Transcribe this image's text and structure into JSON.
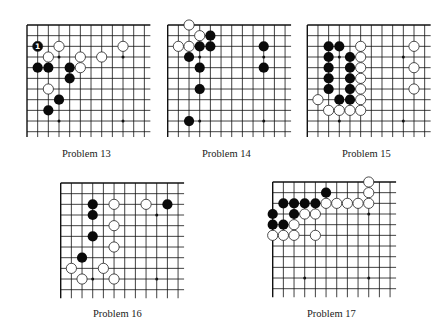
{
  "page": {
    "colors": {
      "line": "#111111",
      "black_stone": "#0a0a0a",
      "white_stone": "#ffffff",
      "background": "#ffffff"
    }
  },
  "problems": [
    {
      "id": "p13",
      "label": "Problem 13",
      "origin": [
        27,
        25
      ],
      "spacing": 10.67,
      "cols": 12,
      "rows": 11,
      "extend": [
        1.0,
        10.5
      ],
      "edges": {
        "top": true,
        "left": true
      },
      "star_points": [
        [
          3,
          3
        ],
        [
          9,
          3
        ],
        [
          3,
          9
        ],
        [
          9,
          9
        ]
      ],
      "black": [
        [
          1,
          4
        ],
        [
          2,
          4
        ],
        [
          4,
          4
        ],
        [
          4,
          5
        ],
        [
          3,
          7
        ],
        [
          2,
          8
        ]
      ],
      "white": [
        [
          3,
          2
        ],
        [
          2,
          3
        ],
        [
          5,
          3
        ],
        [
          5,
          4
        ],
        [
          7,
          3
        ],
        [
          9,
          2
        ],
        [
          2,
          6
        ]
      ],
      "numbered": [
        {
          "pos": [
            1,
            2
          ],
          "color": "black",
          "text": "1"
        }
      ],
      "label_pos": [
        62,
        150
      ]
    },
    {
      "id": "p14",
      "label": "Problem 14",
      "origin": [
        167.7,
        25
      ],
      "spacing": 10.67,
      "cols": 12,
      "rows": 11,
      "extend": [
        1.0,
        10.5
      ],
      "edges": {
        "top": true,
        "left": true
      },
      "star_points": [
        [
          3,
          3
        ],
        [
          9,
          3
        ],
        [
          3,
          9
        ],
        [
          9,
          9
        ]
      ],
      "black": [
        [
          4,
          1
        ],
        [
          3,
          2
        ],
        [
          4,
          2
        ],
        [
          2,
          3
        ],
        [
          3,
          4
        ],
        [
          3,
          6
        ],
        [
          2,
          9
        ],
        [
          9,
          2
        ],
        [
          9,
          4
        ]
      ],
      "white": [
        [
          2,
          0
        ],
        [
          3,
          1
        ],
        [
          1,
          2
        ],
        [
          2,
          2
        ]
      ],
      "numbered": [],
      "label_pos": [
        202,
        150
      ]
    },
    {
      "id": "p15",
      "label": "Problem 15",
      "origin": [
        307.3,
        25
      ],
      "spacing": 10.67,
      "cols": 12,
      "rows": 11,
      "extend": [
        1.0,
        10.5
      ],
      "edges": {
        "top": true,
        "left": true
      },
      "star_points": [
        [
          3,
          3
        ],
        [
          9,
          3
        ],
        [
          3,
          9
        ],
        [
          9,
          9
        ]
      ],
      "black": [
        [
          2,
          2
        ],
        [
          3,
          2
        ],
        [
          2,
          3
        ],
        [
          4,
          3
        ],
        [
          2,
          4
        ],
        [
          4,
          4
        ],
        [
          2,
          5
        ],
        [
          4,
          5
        ],
        [
          2,
          6
        ],
        [
          4,
          6
        ],
        [
          3,
          7
        ],
        [
          4,
          7
        ]
      ],
      "white": [
        [
          5,
          2
        ],
        [
          5,
          3
        ],
        [
          5,
          4
        ],
        [
          5,
          5
        ],
        [
          5,
          6
        ],
        [
          1,
          7
        ],
        [
          5,
          7
        ],
        [
          2,
          8
        ],
        [
          3,
          8
        ],
        [
          4,
          8
        ],
        [
          5,
          8
        ],
        [
          10,
          2
        ],
        [
          10,
          4
        ],
        [
          10,
          6
        ]
      ],
      "numbered": [],
      "label_pos": [
        342,
        150
      ]
    },
    {
      "id": "p16",
      "label": "Problem 16",
      "origin": [
        60.7,
        183
      ],
      "spacing": 10.67,
      "cols": 12,
      "rows": 11,
      "extend": [
        1.0,
        10.8
      ],
      "edges": {
        "top": true,
        "left": true
      },
      "star_points": [
        [
          3,
          3
        ],
        [
          9,
          3
        ],
        [
          3,
          9
        ],
        [
          9,
          9
        ]
      ],
      "black": [
        [
          3,
          2
        ],
        [
          3,
          3
        ],
        [
          3,
          5
        ],
        [
          2,
          7
        ],
        [
          10,
          2
        ]
      ],
      "white": [
        [
          5,
          2
        ],
        [
          8,
          2
        ],
        [
          5,
          4
        ],
        [
          5,
          6
        ],
        [
          1,
          8
        ],
        [
          4,
          8
        ],
        [
          2,
          9
        ],
        [
          5,
          9
        ]
      ],
      "numbered": [],
      "label_pos": [
        93,
        310
      ]
    },
    {
      "id": "p17",
      "label": "Problem 17",
      "origin": [
        272.7,
        182
      ],
      "spacing": 10.67,
      "cols": 12,
      "rows": 11,
      "extend": [
        1.0,
        10.8
      ],
      "edges": {
        "top": true,
        "left": true
      },
      "star_points": [
        [
          3,
          3
        ],
        [
          9,
          3
        ],
        [
          3,
          9
        ],
        [
          9,
          9
        ]
      ],
      "black": [
        [
          5,
          1
        ],
        [
          1,
          2
        ],
        [
          2,
          2
        ],
        [
          3,
          2
        ],
        [
          4,
          2
        ],
        [
          0,
          3
        ],
        [
          2,
          3
        ],
        [
          0,
          4
        ],
        [
          1,
          4
        ]
      ],
      "white": [
        [
          9,
          0
        ],
        [
          9,
          1
        ],
        [
          5,
          2
        ],
        [
          6,
          2
        ],
        [
          7,
          2
        ],
        [
          8,
          2
        ],
        [
          9,
          2
        ],
        [
          3,
          3
        ],
        [
          4,
          3
        ],
        [
          2,
          4
        ],
        [
          0,
          5
        ],
        [
          1,
          5
        ],
        [
          2,
          5
        ],
        [
          4,
          5
        ]
      ],
      "numbered": [],
      "label_pos": [
        307,
        310
      ]
    }
  ]
}
